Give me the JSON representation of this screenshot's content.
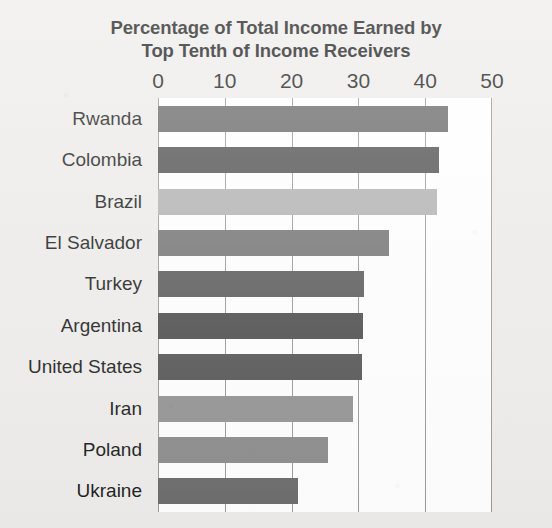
{
  "chart_data": {
    "type": "bar",
    "orientation": "horizontal",
    "title": "Percentage of Total Income Earned by Top Tenth of Income Receivers",
    "title_lines": [
      "Percentage of Total Income Earned by",
      "Top Tenth of Income Receivers"
    ],
    "xlabel": "",
    "ylabel": "",
    "xlim": [
      0,
      50
    ],
    "ylim": null,
    "xticks": [
      0,
      10,
      20,
      30,
      40,
      50
    ],
    "xtick_labels": [
      "0",
      "10",
      "20",
      "30",
      "40",
      "50"
    ],
    "grid": "vertical",
    "legend": "none",
    "categories": [
      "Rwanda",
      "Colombia",
      "Brazil",
      "El Salvador",
      "Turkey",
      "Argentina",
      "United States",
      "Iran",
      "Poland",
      "Ukraine"
    ],
    "values": [
      43.4,
      42.1,
      41.8,
      34.6,
      30.9,
      30.7,
      30.5,
      29.2,
      25.5,
      21.0
    ],
    "bar_colors": [
      "#6b6b6b",
      "#545454",
      "#b4b4b4",
      "#767676",
      "#5c5c5c",
      "#4f4f4f",
      "#565656",
      "#949494",
      "#8d8d8d",
      "#6d6d6d"
    ],
    "bars": [
      {
        "label": "Rwanda",
        "value": 43.4,
        "color": "#6b6b6b"
      },
      {
        "label": "Colombia",
        "value": 42.1,
        "color": "#545454"
      },
      {
        "label": "Brazil",
        "value": 41.8,
        "color": "#b4b4b4"
      },
      {
        "label": "El Salvador",
        "value": 34.6,
        "color": "#767676"
      },
      {
        "label": "Turkey",
        "value": 30.9,
        "color": "#5c5c5c"
      },
      {
        "label": "Argentina",
        "value": 30.7,
        "color": "#4f4f4f"
      },
      {
        "label": "United States",
        "value": 30.5,
        "color": "#565656"
      },
      {
        "label": "Iran",
        "value": 29.2,
        "color": "#949494"
      },
      {
        "label": "Poland",
        "value": 25.5,
        "color": "#8d8d8d"
      },
      {
        "label": "Ukraine",
        "value": 21.0,
        "color": "#6d6d6d"
      }
    ],
    "colors": {
      "background": "#eeedeb",
      "plot_background": "#ffffff",
      "gridline": "#9a9a9a",
      "text": "#1d1d1d"
    }
  }
}
